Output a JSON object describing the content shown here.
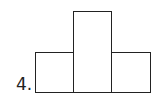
{
  "problem": {
    "number_label": "4."
  },
  "figure": {
    "shape": "three adjacent rectangles, taller middle rectangle",
    "stroke_color": "#222222",
    "rectangles": [
      {
        "name": "left",
        "x": 35,
        "y": 52,
        "w": 39,
        "h": 40
      },
      {
        "name": "middle",
        "x": 73,
        "y": 11,
        "w": 39,
        "h": 81
      },
      {
        "name": "right",
        "x": 111,
        "y": 52,
        "w": 40,
        "h": 40
      }
    ]
  }
}
